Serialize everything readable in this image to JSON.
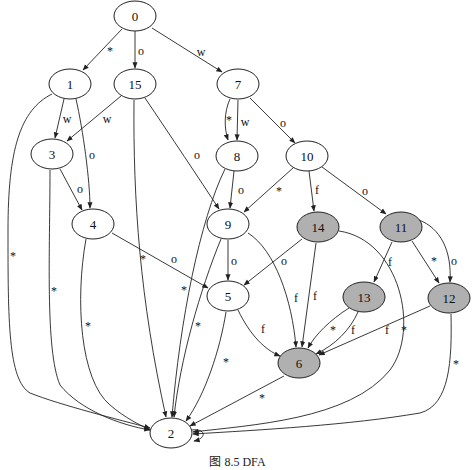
{
  "diagram": {
    "type": "state-transition-graph",
    "colors": {
      "accepting_fill": "#b0b0b0",
      "normal_fill": "#ffffff",
      "stroke": "#222222"
    },
    "nodes": [
      {
        "id": "0",
        "x": 135,
        "y": 16,
        "accepting": false
      },
      {
        "id": "1",
        "x": 70,
        "y": 84,
        "accepting": false
      },
      {
        "id": "15",
        "x": 135,
        "y": 84,
        "accepting": false
      },
      {
        "id": "7",
        "x": 238,
        "y": 84,
        "accepting": false
      },
      {
        "id": "3",
        "x": 52,
        "y": 154,
        "accepting": false
      },
      {
        "id": "8",
        "x": 237,
        "y": 156,
        "accepting": false
      },
      {
        "id": "10",
        "x": 307,
        "y": 156,
        "accepting": false
      },
      {
        "id": "4",
        "x": 93,
        "y": 224,
        "accepting": false
      },
      {
        "id": "9",
        "x": 228,
        "y": 224,
        "accepting": false
      },
      {
        "id": "14",
        "x": 318,
        "y": 227,
        "accepting": true
      },
      {
        "id": "11",
        "x": 401,
        "y": 227,
        "accepting": true
      },
      {
        "id": "5",
        "x": 228,
        "y": 296,
        "accepting": false
      },
      {
        "id": "13",
        "x": 364,
        "y": 297,
        "accepting": true
      },
      {
        "id": "12",
        "x": 449,
        "y": 298,
        "accepting": true
      },
      {
        "id": "6",
        "x": 299,
        "y": 363,
        "accepting": true
      },
      {
        "id": "2",
        "x": 171,
        "y": 433,
        "accepting": false
      }
    ],
    "edges": [
      {
        "from": "0",
        "to": "1",
        "label": "*"
      },
      {
        "from": "0",
        "to": "15",
        "label": "o"
      },
      {
        "from": "0",
        "to": "7",
        "label": "w"
      },
      {
        "from": "1",
        "to": "3",
        "label": "w"
      },
      {
        "from": "1",
        "to": "4",
        "label": "o"
      },
      {
        "from": "1",
        "to": "2",
        "label": "*"
      },
      {
        "from": "15",
        "to": "3",
        "label": "w"
      },
      {
        "from": "15",
        "to": "9",
        "label": "o"
      },
      {
        "from": "15",
        "to": "2",
        "label": "*"
      },
      {
        "from": "7",
        "to": "8",
        "label": "*"
      },
      {
        "from": "7",
        "to": "8",
        "label": "w"
      },
      {
        "from": "7",
        "to": "10",
        "label": "o"
      },
      {
        "from": "3",
        "to": "4",
        "label": "o"
      },
      {
        "from": "3",
        "to": "2",
        "label": "*"
      },
      {
        "from": "8",
        "to": "9",
        "label": "o"
      },
      {
        "from": "8",
        "to": "2",
        "label": "*"
      },
      {
        "from": "10",
        "to": "9",
        "label": "*"
      },
      {
        "from": "10",
        "to": "14",
        "label": "f"
      },
      {
        "from": "10",
        "to": "11",
        "label": "o"
      },
      {
        "from": "4",
        "to": "5",
        "label": "o"
      },
      {
        "from": "4",
        "to": "2",
        "label": "*"
      },
      {
        "from": "9",
        "to": "5",
        "label": "o"
      },
      {
        "from": "9",
        "to": "6",
        "label": "f"
      },
      {
        "from": "9",
        "to": "2",
        "label": "*"
      },
      {
        "from": "14",
        "to": "5",
        "label": "o"
      },
      {
        "from": "14",
        "to": "6",
        "label": "f"
      },
      {
        "from": "14",
        "to": "2",
        "label": "*"
      },
      {
        "from": "11",
        "to": "13",
        "label": "f"
      },
      {
        "from": "11",
        "to": "12",
        "label": "*"
      },
      {
        "from": "11",
        "to": "12",
        "label": "o"
      },
      {
        "from": "5",
        "to": "6",
        "label": "f"
      },
      {
        "from": "5",
        "to": "2",
        "label": "*"
      },
      {
        "from": "13",
        "to": "6",
        "label": "*"
      },
      {
        "from": "13",
        "to": "6",
        "label": "f"
      },
      {
        "from": "12",
        "to": "6",
        "label": "f"
      },
      {
        "from": "12",
        "to": "2",
        "label": "*"
      },
      {
        "from": "6",
        "to": "2",
        "label": "*"
      },
      {
        "from": "2",
        "to": "2",
        "label": ""
      }
    ],
    "node_labels": {
      "n0": "0",
      "n1": "1",
      "n15": "15",
      "n7": "7",
      "n3": "3",
      "n8": "8",
      "n10": "10",
      "n4": "4",
      "n9": "9",
      "n14": "14",
      "n11": "11",
      "n5": "5",
      "n13": "13",
      "n12": "12",
      "n6": "6",
      "n2": "2"
    },
    "edge_labels": {
      "e0_1": "*",
      "e0_15": "o",
      "e0_7": "w",
      "e1_3": "w",
      "e1_4": "o",
      "e1_2": "*",
      "e15_3": "w",
      "e15_9": "o",
      "e15_2": "*",
      "e7_8a": "*",
      "e7_8b": "w",
      "e7_10": "o",
      "e3_4": "o",
      "e3_2": "*",
      "e8_9": "o",
      "e8_2": "*",
      "e10_9": "*",
      "e10_14": "f",
      "e10_11": "o",
      "e4_5": "o",
      "e4_2": "*",
      "e9_5": "o",
      "e9_6": "f",
      "e9_2": "*",
      "e14_5": "o",
      "e14_6": "f",
      "e14_2": "*",
      "e11_13": "f",
      "e11_12a": "*",
      "e11_12b": "o",
      "e5_6": "f",
      "e5_2": "*",
      "e13_6a": "*",
      "e13_6b": "f",
      "e12_6": "f",
      "e12_2": "*",
      "e6_2": "*"
    }
  },
  "caption": "图 8.5 DFA"
}
